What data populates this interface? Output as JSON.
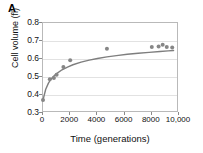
{
  "figure": {
    "panel_label": "A",
    "background_color": "#ffffff",
    "text_color": "#111111"
  },
  "chart_data": {
    "type": "scatter",
    "title": "",
    "subtitle": "",
    "xlabel": "Time (generations)",
    "ylabel": "Cell volume (fl)",
    "xlim": [
      0,
      10000
    ],
    "ylim": [
      0.3,
      0.8
    ],
    "xticks": [
      0,
      2000,
      4000,
      6000,
      8000,
      10000
    ],
    "xticklabels": [
      "0",
      "2000",
      "4000",
      "6000",
      "8000",
      "10,000"
    ],
    "yticks": [
      0.3,
      0.4,
      0.5,
      0.6,
      0.7,
      0.8
    ],
    "yticklabels": [
      "0.3",
      "0.4",
      "0.5",
      "0.6",
      "0.7",
      "0.8"
    ],
    "grid": "horizontal",
    "legend": "none",
    "marker_color": "#868686",
    "line_color": "#7e7e7e",
    "marker_shape": "circle",
    "series": [
      {
        "name": "Cell volume",
        "x": [
          0,
          500,
          800,
          1000,
          1500,
          2000,
          4700,
          8000,
          8500,
          8800,
          9100,
          9500
        ],
        "y": [
          0.372,
          0.487,
          0.495,
          0.513,
          0.556,
          0.593,
          0.657,
          0.666,
          0.669,
          0.679,
          0.667,
          0.664
        ]
      }
    ],
    "fit_curve": {
      "name": "hyperbolic fit",
      "description": "saturating hyperbolic fit through the data",
      "x": [
        0,
        200,
        400,
        600,
        800,
        1000,
        1400,
        1800,
        2200,
        2800,
        3400,
        4000,
        4700,
        5400,
        6200,
        7000,
        7800,
        8600,
        9200,
        9600
      ],
      "y": [
        0.372,
        0.432,
        0.466,
        0.489,
        0.506,
        0.519,
        0.54,
        0.555,
        0.568,
        0.583,
        0.594,
        0.603,
        0.612,
        0.619,
        0.626,
        0.632,
        0.637,
        0.642,
        0.645,
        0.647
      ]
    }
  }
}
